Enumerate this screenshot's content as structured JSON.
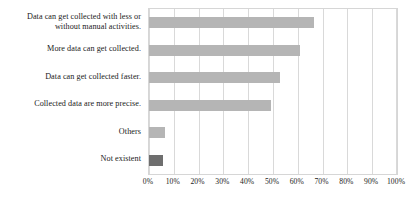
{
  "chart_data": {
    "type": "bar",
    "orientation": "horizontal",
    "title": "",
    "subtitle": "",
    "xlabel": "",
    "ylabel": "",
    "xlim": [
      0,
      100
    ],
    "x_tick_labels": [
      "0%",
      "10%",
      "20%",
      "30%",
      "40%",
      "50%",
      "60%",
      "70%",
      "80%",
      "90%",
      "100%"
    ],
    "x_tick_values": [
      0,
      10,
      20,
      30,
      40,
      50,
      60,
      70,
      80,
      90,
      100
    ],
    "x_tick_suffix": "%",
    "grid": true,
    "grid_axis": "x",
    "legend": false,
    "legend_position": "none",
    "categories": [
      "Data can get collected with less or without manual activities.",
      "More data can get collected.",
      "Data can get collected faster.",
      "Collected data are more precise.",
      "Others",
      "Not existent"
    ],
    "values": [
      66.5,
      61,
      53,
      49,
      6.5,
      5.5
    ],
    "bar_colors": [
      "#b5b5b5",
      "#b5b5b5",
      "#b5b5b5",
      "#b5b5b5",
      "#b5b5b5",
      "#6e6e6e"
    ],
    "series": [
      {
        "name": "Share of respondents",
        "values": [
          66.5,
          61,
          53,
          49,
          6.5,
          5.5
        ]
      }
    ]
  },
  "style": {
    "background": "#ffffff",
    "bar_fill": "#b5b5b5",
    "bar_fill_highlight": "#6e6e6e",
    "grid_color": "#d9d9d9",
    "frame_color": "#d6d6d6",
    "text_color": "#1a1a1a"
  },
  "category_labels": [
    {
      "line1": "Data can get collected with less or",
      "line2": "without manual activities."
    },
    {
      "line1": "More data can get collected.",
      "line2": ""
    },
    {
      "line1": "Data can get collected faster.",
      "line2": ""
    },
    {
      "line1": "Collected data are more precise.",
      "line2": ""
    },
    {
      "line1": "Others",
      "line2": ""
    },
    {
      "line1": "Not existent",
      "line2": ""
    }
  ]
}
